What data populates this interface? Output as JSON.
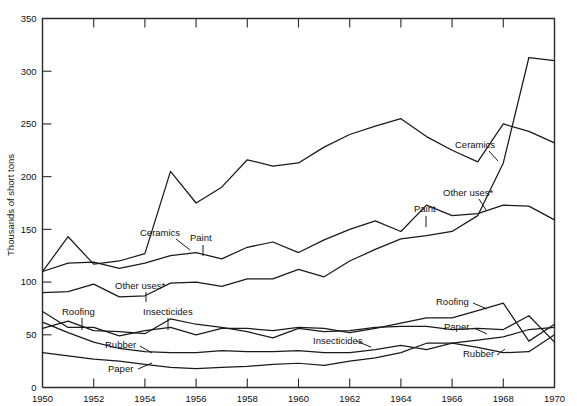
{
  "chart_data": {
    "type": "line",
    "title": "",
    "subtitle": "",
    "xlabel": "",
    "ylabel": "Thousands of short tons",
    "xlim": [
      1950,
      1970
    ],
    "ylim": [
      0,
      350
    ],
    "yticks": [
      0,
      50,
      100,
      150,
      200,
      250,
      300,
      350
    ],
    "xticks": [
      1950,
      1952,
      1954,
      1956,
      1958,
      1960,
      1962,
      1964,
      1966,
      1968,
      1970
    ],
    "grid": false,
    "legend_position": "inline-annotations",
    "footnote_marker": "*",
    "x": [
      1950,
      1951,
      1952,
      1953,
      1954,
      1955,
      1956,
      1957,
      1958,
      1959,
      1960,
      1961,
      1962,
      1963,
      1964,
      1965,
      1966,
      1967,
      1968,
      1969,
      1970
    ],
    "series": [
      {
        "name": "Ceramics",
        "label": "Ceramics",
        "values": [
          110,
          143,
          117,
          120,
          127,
          205,
          175,
          190,
          216,
          210,
          213,
          228,
          240,
          248,
          255,
          238,
          225,
          214,
          250,
          243,
          232
        ]
      },
      {
        "name": "Paint",
        "label": "Paint",
        "values": [
          110,
          118,
          119,
          113,
          118,
          125,
          128,
          122,
          133,
          138,
          128,
          140,
          150,
          158,
          148,
          173,
          163,
          165,
          173,
          172,
          159
        ]
      },
      {
        "name": "Other uses*",
        "label": "Other uses*",
        "values": [
          90,
          91,
          98,
          86,
          87,
          99,
          100,
          96,
          103,
          103,
          112,
          105,
          120,
          131,
          141,
          144,
          148,
          163,
          213,
          313,
          310
        ]
      },
      {
        "name": "Roofing",
        "label": "Roofing",
        "values": [
          72,
          57,
          57,
          49,
          54,
          57,
          50,
          56,
          56,
          54,
          57,
          56,
          52,
          56,
          61,
          66,
          66,
          73,
          80,
          44,
          60
        ]
      },
      {
        "name": "Insecticides",
        "label": "Insecticides",
        "values": [
          56,
          63,
          54,
          53,
          51,
          65,
          60,
          57,
          53,
          47,
          56,
          53,
          54,
          57,
          58,
          58,
          55,
          56,
          55,
          68,
          43
        ]
      },
      {
        "name": "Rubber",
        "label": "Rubber",
        "values": [
          62,
          52,
          43,
          37,
          34,
          33,
          33,
          35,
          34,
          34,
          35,
          33,
          33,
          36,
          40,
          36,
          42,
          38,
          33,
          34,
          50
        ]
      },
      {
        "name": "Paper",
        "label": "Paper",
        "values": [
          33,
          30,
          27,
          25,
          22,
          19,
          18,
          19,
          20,
          22,
          23,
          21,
          25,
          28,
          33,
          42,
          42,
          45,
          48,
          55,
          57
        ]
      }
    ],
    "annotations": [
      {
        "text": "Ceramics",
        "x": 140,
        "y": 236,
        "lx1": 176,
        "ly1": 239,
        "lx2": 190,
        "ly2": 250
      },
      {
        "text": "Paint",
        "x": 190,
        "y": 241,
        "lx1": 203,
        "ly1": 245,
        "lx2": 203,
        "ly2": 256
      },
      {
        "text": "Other uses*",
        "x": 115,
        "y": 289,
        "lx1": 146,
        "ly1": 292,
        "lx2": 146,
        "ly2": 302
      },
      {
        "text": "Ceramics",
        "x": 455,
        "y": 148,
        "lx1": 489,
        "ly1": 151,
        "lx2": 498,
        "ly2": 161
      },
      {
        "text": "Other uses*",
        "x": 443,
        "y": 196,
        "lx1": 479,
        "ly1": 199,
        "lx2": 486,
        "ly2": 210
      },
      {
        "text": "Paint",
        "x": 414,
        "y": 212,
        "lx1": 426,
        "ly1": 216,
        "lx2": 426,
        "ly2": 227
      },
      {
        "text": "Roofing",
        "x": 62,
        "y": 315,
        "lx1": 82,
        "ly1": 318,
        "lx2": 82,
        "ly2": 330
      },
      {
        "text": "Insecticides",
        "x": 143,
        "y": 315,
        "lx1": 168,
        "ly1": 318,
        "lx2": 168,
        "ly2": 330
      },
      {
        "text": "Rubber",
        "x": 105,
        "y": 348,
        "lx1": 140,
        "ly1": 346,
        "lx2": 152,
        "ly2": 353
      },
      {
        "text": "Paper",
        "x": 108,
        "y": 372,
        "lx1": 138,
        "ly1": 369,
        "lx2": 152,
        "ly2": 363
      },
      {
        "text": "Roofing",
        "x": 436,
        "y": 305,
        "lx1": 473,
        "ly1": 303,
        "lx2": 487,
        "ly2": 309
      },
      {
        "text": "Insecticides",
        "x": 313,
        "y": 344,
        "lx1": 356,
        "ly1": 341,
        "lx2": 371,
        "ly2": 347
      },
      {
        "text": "Paper",
        "x": 444,
        "y": 330,
        "lx1": 474,
        "ly1": 328,
        "lx2": 487,
        "ly2": 334
      },
      {
        "text": "Rubber",
        "x": 463,
        "y": 357,
        "lx1": 497,
        "ly1": 355,
        "lx2": 505,
        "ly2": 349
      }
    ]
  }
}
